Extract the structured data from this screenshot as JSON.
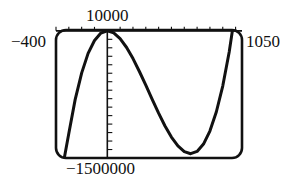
{
  "chart_data": {
    "type": "line",
    "title": "",
    "xlabel": "",
    "ylabel": "",
    "window": {
      "xmin": -400,
      "xmax": 1050,
      "xscl": 100,
      "ymin": -1500000,
      "ymax": 10000,
      "yscl": 100000
    },
    "axis_labels": {
      "xmin": "−400",
      "xmax": "1050",
      "ymax": "10000",
      "ymin": "−1500000"
    },
    "grid": false,
    "legend": null,
    "series": [
      {
        "name": "cubic curve",
        "description": "Cubic with local maximum near (0, 0) and local minimum near (650, -1450000); enters from bottom near x=-335, exits top near x=976",
        "x": [
          -335,
          -300,
          -250,
          -200,
          -150,
          -100,
          -50,
          0,
          50,
          100,
          150,
          200,
          250,
          300,
          350,
          400,
          450,
          500,
          550,
          600,
          650,
          700,
          750,
          800,
          850,
          900,
          950,
          976
        ],
        "y": [
          -1500000,
          -1212000,
          -809000,
          -496000,
          -266000,
          -114000,
          -27000,
          0,
          -24000,
          -92000,
          -196000,
          -327000,
          -479000,
          -641000,
          -809000,
          -972000,
          -1123000,
          -1254000,
          -1357000,
          -1424000,
          -1449000,
          -1422000,
          -1336000,
          -1183000,
          -957000,
          -648000,
          -249000,
          10000
        ]
      }
    ]
  }
}
